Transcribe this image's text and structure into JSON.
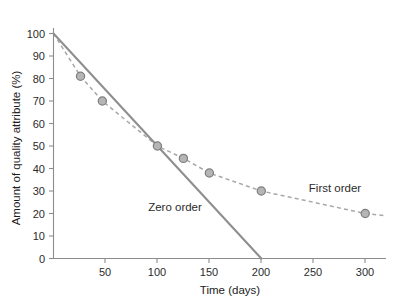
{
  "chart_data": {
    "type": "line",
    "title": "",
    "xlabel": "Time (days)",
    "ylabel": "Amount of quality attribute (%)",
    "xlim": [
      0,
      320
    ],
    "ylim": [
      0,
      100
    ],
    "xticks": [
      50,
      100,
      150,
      200,
      250,
      300
    ],
    "yticks": [
      0,
      10,
      20,
      30,
      40,
      50,
      60,
      70,
      80,
      90,
      100
    ],
    "grid": false,
    "legend_position": "inline-annotations",
    "series": [
      {
        "name": "Zero order",
        "style": "solid",
        "color": "#8f8f8f",
        "markers": false,
        "x": [
          0,
          200
        ],
        "y": [
          100,
          0
        ]
      },
      {
        "name": "First order",
        "style": "dashed",
        "color": "#a0a0a0",
        "markers": true,
        "x": [
          0,
          26,
          47,
          100,
          125,
          150,
          200,
          300,
          320
        ],
        "y": [
          100,
          81,
          70,
          50,
          44.5,
          38,
          30,
          20,
          19
        ]
      }
    ],
    "data_points": {
      "series": "First order",
      "x": [
        26,
        47,
        100,
        125,
        150,
        200,
        300
      ],
      "y": [
        81,
        70,
        50,
        44.5,
        38,
        30,
        20
      ]
    },
    "annotations": [
      {
        "text": "Zero order",
        "x_px": 134,
        "y_px": 211
      },
      {
        "text": "First order",
        "x_px": 303,
        "y_px": 192
      }
    ]
  },
  "axes": {
    "y_tick_labels": [
      "100",
      "90",
      "80",
      "70",
      "60",
      "50",
      "40",
      "30",
      "20",
      "10",
      "0"
    ],
    "x_tick_labels": [
      "50",
      "100",
      "150",
      "200",
      "250",
      "300"
    ],
    "x_axis_title": "Time (days)",
    "y_axis_title": "Amount of quality attribute (%)"
  },
  "colors": {
    "zero_order_line": "#8f8f8f",
    "first_order_line": "#a8a8a8",
    "marker_fill": "#b5b5b5",
    "marker_stroke": "#7d7d7d",
    "axis": "#8c8c8c",
    "text": "#2b2b2b",
    "background": "#ffffff"
  }
}
